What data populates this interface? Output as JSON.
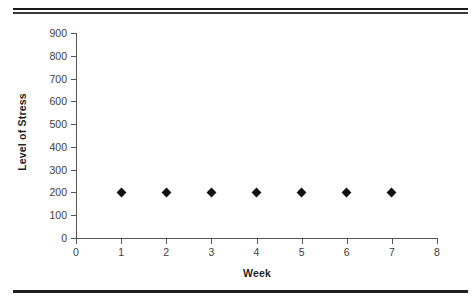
{
  "page": {
    "background_color": "#ffffff",
    "rule_color": "#1a1a1a",
    "top_rule_1_label": "top-horizontal-rule-1",
    "top_rule_2_label": "top-horizontal-rule-2",
    "bottom_rule_label": "bottom-horizontal-rule"
  },
  "chart_data": {
    "type": "scatter",
    "title": "",
    "xlabel": "Week",
    "ylabel": "Level of Stress",
    "x": [
      1,
      2,
      3,
      4,
      5,
      6,
      7
    ],
    "values": [
      200,
      200,
      200,
      200,
      200,
      200,
      200
    ],
    "series": [
      {
        "name": "Level of Stress",
        "marker": "diamond",
        "marker_color": "#111111",
        "values": [
          200,
          200,
          200,
          200,
          200,
          200,
          200
        ]
      }
    ],
    "xlim": [
      0,
      8
    ],
    "ylim": [
      0,
      900
    ],
    "xticks": [
      0,
      1,
      2,
      3,
      4,
      5,
      6,
      7,
      8
    ],
    "yticks": [
      0,
      100,
      200,
      300,
      400,
      500,
      600,
      700,
      800,
      900
    ],
    "xtick_labels": [
      "0",
      "1",
      "2",
      "3",
      "4",
      "5",
      "6",
      "7",
      "8"
    ],
    "ytick_labels": [
      "0",
      "100",
      "200",
      "300",
      "400",
      "500",
      "600",
      "700",
      "800",
      "900"
    ],
    "grid": false,
    "legend": false,
    "axis_color": "#555555"
  }
}
